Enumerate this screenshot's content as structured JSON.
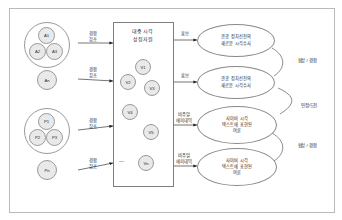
{
  "diagram": {
    "title_box": {
      "line1": "대중 시각",
      "line2": "상징자원"
    },
    "left_groups": [
      {
        "name": "group-a",
        "nodes": [
          "A1",
          "A2",
          "A3"
        ]
      },
      {
        "name": "single-an",
        "nodes": [
          "An"
        ]
      },
      {
        "name": "group-p",
        "nodes": [
          "P1",
          "P2",
          "P3"
        ]
      },
      {
        "name": "single-pn",
        "nodes": [
          "Pn"
        ]
      }
    ],
    "left_arrow_labels": [
      {
        "line1": "경합",
        "line2": "참조"
      },
      {
        "line1": "경합",
        "line2": "참조"
      },
      {
        "line1": "경합",
        "line2": "참조"
      },
      {
        "line1": "경합",
        "line2": "참조"
      }
    ],
    "visual_nodes": [
      "V1",
      "V2",
      "V3",
      "V4",
      "V5",
      "Vn"
    ],
    "ellipsis": "—",
    "mid_arrow_labels": [
      {
        "line1": "홍보",
        "line2": ""
      },
      {
        "line1": "홍보",
        "line2": ""
      },
      {
        "line1": "비주얼",
        "line2": "에피데믹"
      },
      {
        "line1": "비주얼",
        "line2": "에피데믹"
      }
    ],
    "right_ellipses": [
      {
        "l1": "관광 정치선전의",
        "l2": "새로운 시각수사",
        "l3": ""
      },
      {
        "l1": "관광 정치선전의",
        "l2": "새로운 시각수사",
        "l3": ""
      },
      {
        "l1": "사이버 시각",
        "l2": "텍스트에 표현된",
        "l3": "여론"
      },
      {
        "l1": "사이버 시각",
        "l2": "텍스트에 표현된",
        "l3": "여론"
      }
    ],
    "right_relation_labels": [
      {
        "text": "협상 / 경합"
      },
      {
        "text": "인정/도전"
      },
      {
        "text": "협상 / 경합"
      }
    ]
  },
  "colors": {
    "frame_border": "#b9b9b9",
    "node_fill": "#e9e9e9",
    "node_stroke": "#9a9a9a",
    "line": "#3a3a3a",
    "text": "#232323"
  }
}
